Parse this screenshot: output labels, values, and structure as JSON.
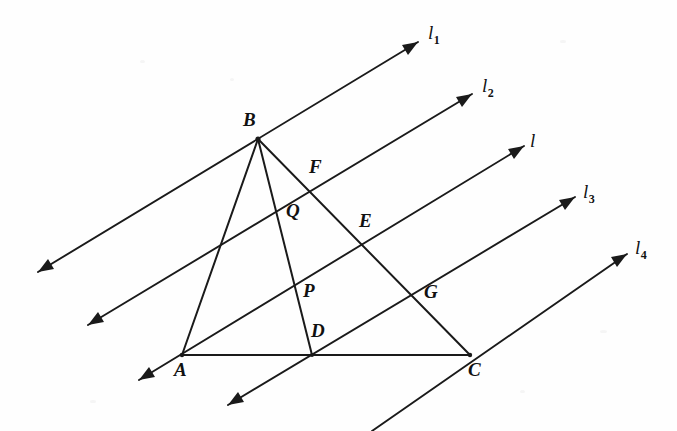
{
  "figure": {
    "background_color": "#fefefe",
    "ink_color": "#1a1a1a",
    "width": 677,
    "height": 431
  },
  "vertices": [
    {
      "name": "A",
      "label": "A",
      "x": 182,
      "y": 355,
      "label_x": 174,
      "label_y": 360
    },
    {
      "name": "B",
      "label": "B",
      "x": 258,
      "y": 139,
      "label_x": 243,
      "label_y": 110
    },
    {
      "name": "C",
      "label": "C",
      "x": 470,
      "y": 355,
      "label_x": 468,
      "label_y": 360
    }
  ],
  "points": [
    {
      "name": "D",
      "label": "D",
      "x": 312,
      "y": 355,
      "label_x": 311,
      "label_y": 321
    },
    {
      "name": "P",
      "label": "P",
      "x": 298,
      "y": 293,
      "label_x": 303,
      "label_y": 281
    },
    {
      "name": "Q",
      "label": "Q",
      "x": 282,
      "y": 208,
      "label_x": 286,
      "label_y": 201
    },
    {
      "name": "E",
      "label": "E",
      "x": 360,
      "y": 245,
      "label_x": 359,
      "label_y": 211
    },
    {
      "name": "F",
      "label": "F",
      "x": 312,
      "y": 190,
      "label_x": 309,
      "label_y": 157
    },
    {
      "name": "G",
      "label": "G",
      "x": 415,
      "y": 292,
      "label_x": 424,
      "label_y": 282
    }
  ],
  "triangle_sides": [
    {
      "name": "side-AB",
      "from": "A",
      "to": "B"
    },
    {
      "name": "side-BC",
      "from": "B",
      "to": "C"
    },
    {
      "name": "side-AC",
      "from": "A",
      "to": "C"
    }
  ],
  "cevian": {
    "name": "cevian-BD",
    "from": "B",
    "to": "D",
    "passes_through": [
      "Q",
      "P"
    ]
  },
  "parallel_lines": [
    {
      "id": "l1",
      "label": "l",
      "subscript": "1",
      "label_x": 428,
      "label_y": 23,
      "x1": 38,
      "y1": 272,
      "x2": 418,
      "y2": 42,
      "arrow_start": true,
      "arrow_end": true,
      "passes_through": [
        "B"
      ]
    },
    {
      "id": "l2",
      "label": "l",
      "subscript": "2",
      "label_x": 482,
      "label_y": 76,
      "x1": 88,
      "y1": 325,
      "x2": 472,
      "y2": 94,
      "arrow_start": true,
      "arrow_end": true,
      "passes_through": [
        "Q",
        "F"
      ]
    },
    {
      "id": "l",
      "label": "l",
      "subscript": "",
      "label_x": 530,
      "label_y": 131,
      "x1": 140,
      "y1": 378,
      "x2": 524,
      "y2": 146,
      "arrow_start": false,
      "arrow_end": true,
      "passes_through": [
        "A",
        "P",
        "E"
      ]
    },
    {
      "id": "l3",
      "label": "l",
      "subscript": "3",
      "label_x": 583,
      "label_y": 182,
      "x1": 190,
      "y1": 430,
      "x2": 575,
      "y2": 197,
      "arrow_start": false,
      "arrow_end": true,
      "passes_through": [
        "D",
        "G"
      ]
    },
    {
      "id": "l4",
      "label": "l",
      "subscript": "4",
      "label_x": 635,
      "label_y": 238,
      "x1": 243,
      "y1": 486,
      "x2": 627,
      "y2": 254,
      "arrow_start": false,
      "arrow_end": true,
      "passes_through": [
        "C"
      ]
    }
  ],
  "extra_arrows": [
    {
      "name": "arrow-l-lower-left",
      "tip_x": 139,
      "tip_y": 380,
      "from_x": 182,
      "from_y": 355
    },
    {
      "name": "arrow-l3-lower-left",
      "tip_x": 228,
      "tip_y": 405,
      "from_x": 275,
      "from_y": 377
    }
  ]
}
